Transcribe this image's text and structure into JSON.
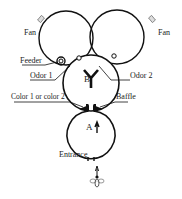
{
  "diagram": {
    "type": "Y-maze olfactometer apparatus",
    "labels": {
      "fan_left": "Fan",
      "fan_right": "Fan",
      "feeder": "Feeder",
      "odor1": "Odor 1",
      "odor2": "Odor 2",
      "chamber_b": "B",
      "color": "Color 1 or color 2",
      "baffle": "Baffle",
      "chamber_a": "A",
      "entrance": "Entrance"
    },
    "colors": {
      "line": "#111111",
      "text": "#222222",
      "fan_box": "#dddddd"
    }
  }
}
